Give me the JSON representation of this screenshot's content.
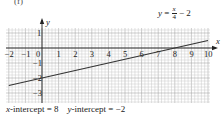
{
  "part_label": "(f)",
  "equation": {
    "lhs": "y",
    "eq": " = ",
    "numerator": "x",
    "denominator": "4",
    "rest": " − 2"
  },
  "caption": {
    "x_intercept_var": "x",
    "x_intercept_text": "-intercept = 8",
    "y_intercept_var": "y",
    "y_intercept_text": "-intercept = −2"
  },
  "colors": {
    "grid_minor": "#c8c8c8",
    "grid_major": "#9a9a9a",
    "axis": "#222222",
    "line": "#333333"
  },
  "chart_data": {
    "type": "line",
    "xlabel": "x",
    "ylabel": "y",
    "xlim": [
      -2.2,
      10.2
    ],
    "ylim": [
      -3.6,
      1.4
    ],
    "x_ticks": [
      -2,
      -1,
      0,
      1,
      2,
      3,
      4,
      5,
      6,
      7,
      8,
      9,
      10
    ],
    "x_tick_labels": [
      "−2",
      "−1",
      "0",
      "1",
      "2",
      "3",
      "4",
      "5",
      "6",
      "7",
      "8",
      "9",
      "10"
    ],
    "y_ticks": [
      1,
      -1,
      -2,
      -3
    ],
    "y_tick_labels": [
      "1",
      "−1",
      "−2",
      "−3"
    ],
    "grid": true,
    "minor_grid_per_unit": 5,
    "series": [
      {
        "name": "y = x/4 − 2",
        "x": [
          -2,
          0,
          8,
          10
        ],
        "y": [
          -2.5,
          -2,
          0,
          0.5
        ]
      }
    ],
    "annotations": [
      "x-intercept = 8",
      "y-intercept = −2"
    ]
  }
}
